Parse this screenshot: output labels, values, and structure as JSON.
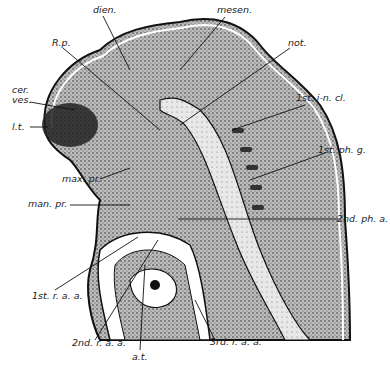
{
  "figure": {
    "labels": {
      "dien": "dien.",
      "mesen": "mesen.",
      "rp": "R.p.",
      "not": "not.",
      "cer": "cer.",
      "ves": "ves.",
      "lt": "l.t.",
      "inc": "1st. i-n. cl.",
      "phg": "1st. ph. g.",
      "maxpr": "max. pr.",
      "manpr": "man. pr.",
      "pha2": "2nd. ph. a.",
      "raa1": "1st. r. a. a.",
      "raa2": "2nd. r. a. a.",
      "raa3": "3rd. r. a. a.",
      "at": "a.t."
    }
  }
}
